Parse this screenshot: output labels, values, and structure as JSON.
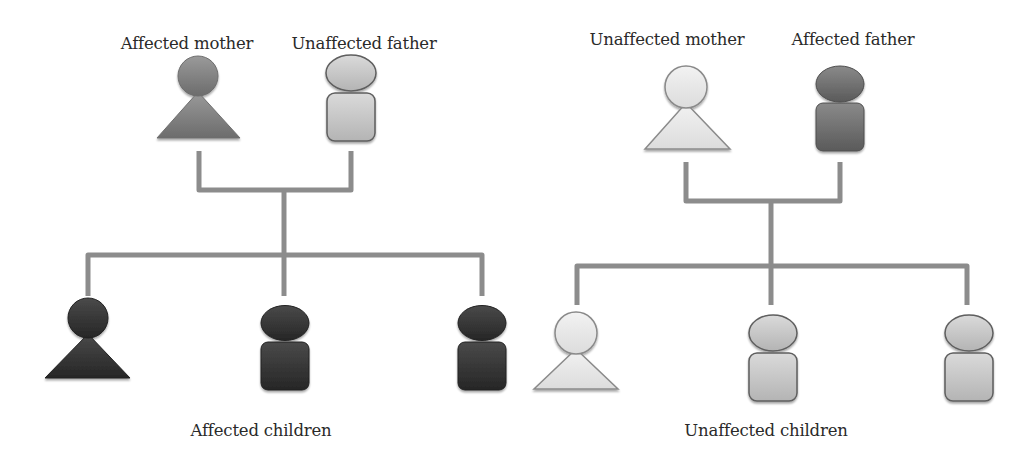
{
  "colors": {
    "connector": "#8c8c8c",
    "affected_parent": "#7a7a7a",
    "affected_child": "#2e2e2e",
    "unaffected_parent_female": "#e6e6e6",
    "unaffected_male": "#c8c8c8",
    "outline": "#6a6a6a",
    "text": "#2a2a2a"
  },
  "left_family": {
    "parents": [
      {
        "label": "Affected mother",
        "sex": "female",
        "status": "affected"
      },
      {
        "label": "Unaffected father",
        "sex": "male",
        "status": "unaffected"
      }
    ],
    "children": [
      {
        "sex": "female",
        "status": "affected"
      },
      {
        "sex": "male",
        "status": "affected"
      },
      {
        "sex": "male",
        "status": "affected"
      }
    ],
    "children_caption": "Affected children"
  },
  "right_family": {
    "parents": [
      {
        "label": "Unaffected mother",
        "sex": "female",
        "status": "unaffected"
      },
      {
        "label": "Affected father",
        "sex": "male",
        "status": "affected"
      }
    ],
    "children": [
      {
        "sex": "female",
        "status": "unaffected"
      },
      {
        "sex": "male",
        "status": "unaffected"
      },
      {
        "sex": "male",
        "status": "unaffected"
      }
    ],
    "children_caption": "Unaffected children"
  }
}
